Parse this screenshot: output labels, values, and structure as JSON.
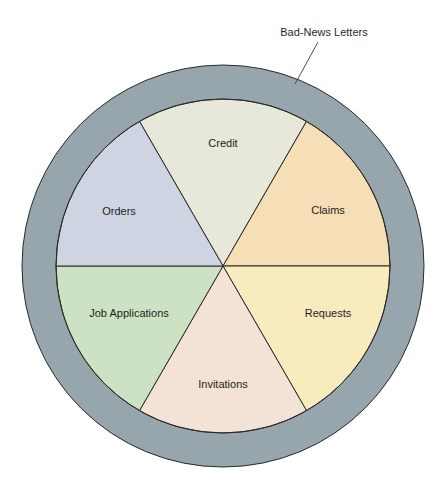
{
  "diagram": {
    "title": "Bad-News Letters",
    "callout": {
      "label": "Bad-News Letters",
      "target": "outer-ring"
    },
    "outer_ring_color": "#97a6ad",
    "outline_color": "#2b2b2b",
    "segments": [
      {
        "label": "Credit",
        "color": "#e7e8d9",
        "position": "top"
      },
      {
        "label": "Claims",
        "color": "#f6dfb7",
        "position": "upper-right"
      },
      {
        "label": "Requests",
        "color": "#f8ebbd",
        "position": "lower-right"
      },
      {
        "label": "Invitations",
        "color": "#f3e2d6",
        "position": "bottom"
      },
      {
        "label": "Job Applications",
        "color": "#cde2c3",
        "position": "lower-left"
      },
      {
        "label": "Orders",
        "color": "#cfd4e2",
        "position": "upper-left"
      }
    ]
  }
}
